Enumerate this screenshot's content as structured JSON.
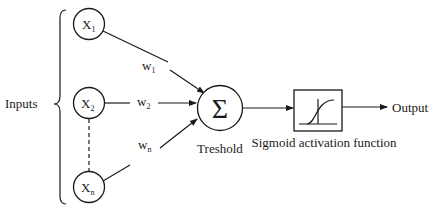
{
  "diagram": {
    "inputs_label": "Inputs",
    "input_nodes": [
      {
        "id": "x1",
        "main": "X",
        "sub": "1"
      },
      {
        "id": "x2",
        "main": "X",
        "sub": "2"
      },
      {
        "id": "xn",
        "main": "X",
        "sub": "n"
      }
    ],
    "weights": [
      {
        "id": "w1",
        "main": "w",
        "sub": "1"
      },
      {
        "id": "w2",
        "main": "w",
        "sub": "2"
      },
      {
        "id": "wn",
        "main": "w",
        "sub": "n"
      }
    ],
    "summation": {
      "symbol": "Σ",
      "label": "Treshold"
    },
    "activation": {
      "label": "Sigmoid activation function",
      "icon": "sigmoid-curve-icon"
    },
    "output_label": "Output",
    "colors": {
      "stroke": "#1a1a1a",
      "background": "#ffffff"
    }
  }
}
